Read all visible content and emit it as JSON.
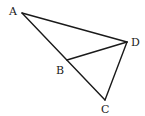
{
  "diagram": {
    "type": "geometry",
    "points": {
      "A": {
        "label": "A",
        "x": 22,
        "y": 13,
        "label_x": 9,
        "label_y": 11
      },
      "B": {
        "label": "B",
        "x": 67,
        "y": 60,
        "label_x": 56,
        "label_y": 70
      },
      "C": {
        "label": "C",
        "x": 105,
        "y": 100,
        "label_x": 101,
        "label_y": 113
      },
      "D": {
        "label": "D",
        "x": 127,
        "y": 42,
        "label_x": 131,
        "label_y": 47
      }
    },
    "segments": [
      {
        "name": "AD",
        "from": "A",
        "to": "D"
      },
      {
        "name": "AC",
        "from": "A",
        "to": "C"
      },
      {
        "name": "BD",
        "from": "B",
        "to": "D"
      },
      {
        "name": "DC",
        "from": "D",
        "to": "C"
      }
    ],
    "colors": {
      "stroke": "#1a1a1a",
      "background": "#ffffff"
    }
  }
}
